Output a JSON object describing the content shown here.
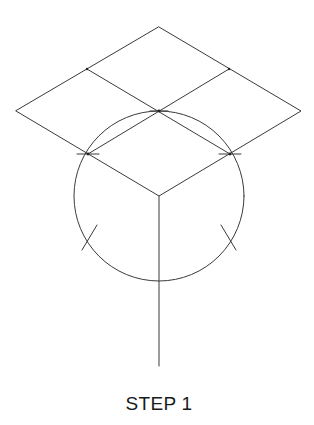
{
  "diagram": {
    "caption": "STEP 1",
    "stroke_color": "#3a3a3a",
    "background": "#ffffff",
    "rhombus": {
      "top": [
        159,
        27
      ],
      "left": [
        16,
        111
      ],
      "right": [
        301,
        111
      ],
      "bottom": [
        159,
        196
      ],
      "center": [
        159,
        111
      ]
    },
    "midpoints": {
      "upper_left": [
        87,
        69
      ],
      "upper_right": [
        229,
        69
      ],
      "lower_left": [
        88,
        154
      ],
      "lower_right": [
        230,
        154
      ]
    },
    "circle": {
      "center": [
        159,
        196
      ],
      "radius": 85
    },
    "axis_line": {
      "from": [
        159,
        196
      ],
      "to": [
        159,
        366
      ]
    },
    "arc_marks": [
      {
        "name": "left",
        "center": [
          86,
          239
        ]
      },
      {
        "name": "right",
        "center": [
          230,
          239
        ]
      }
    ]
  }
}
